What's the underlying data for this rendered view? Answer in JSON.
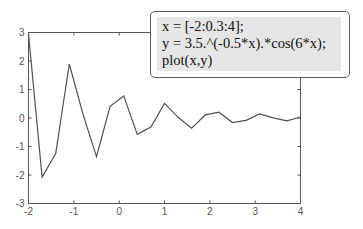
{
  "chart_data": {
    "type": "line",
    "title": "",
    "xlabel": "",
    "ylabel": "",
    "xlim": [
      -2,
      4
    ],
    "ylim": [
      -3,
      3
    ],
    "xticks": [
      -2,
      -1,
      0,
      1,
      2,
      3,
      4
    ],
    "yticks": [
      -3,
      -2,
      -1,
      0,
      1,
      2,
      3
    ],
    "grid": false,
    "legend": null,
    "series": [
      {
        "name": "y",
        "x": [
          -2,
          -1.7,
          -1.4,
          -1.1,
          -0.8,
          -0.5,
          -0.2,
          0.1,
          0.4,
          0.7,
          1.0,
          1.3,
          1.6,
          1.9,
          2.2,
          2.5,
          2.8,
          3.1,
          3.4,
          3.7,
          4.0
        ],
        "values": [
          2.954,
          -2.07,
          -1.248,
          1.893,
          0.144,
          -1.354,
          0.411,
          0.775,
          -0.574,
          -0.316,
          0.513,
          0.024,
          -0.361,
          0.112,
          0.203,
          -0.159,
          -0.081,
          0.139,
          0.003,
          -0.098,
          0.035
        ]
      }
    ],
    "line_color": "#505050"
  },
  "annotation": {
    "lines": [
      "x = [-2:0.3:4];",
      "y = 3.5.^(-0.5*x).*cos(6*x);",
      "plot(x,y)"
    ]
  }
}
